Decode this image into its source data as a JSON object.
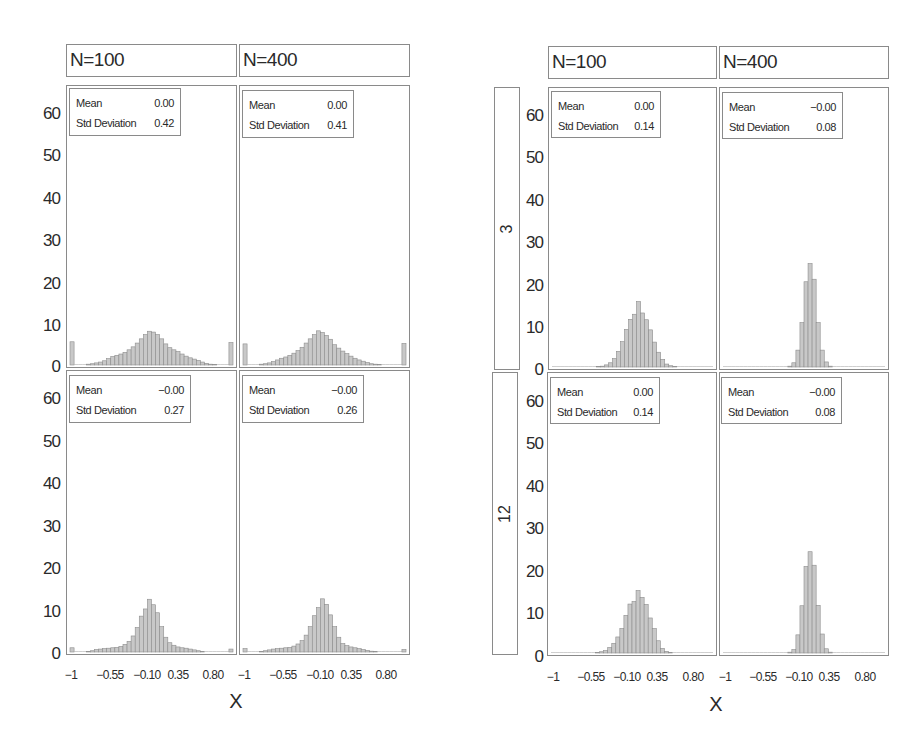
{
  "chart_data": [
    {
      "type": "bar",
      "group": "left",
      "column": "N=100",
      "row": "top",
      "title": "N=100",
      "xlabel": "X",
      "ylabel": "",
      "xticks": [
        "-1",
        "-0.55",
        "-0.10",
        "0.35",
        "0.80"
      ],
      "yticks": [
        0,
        10,
        20,
        30,
        40,
        50,
        60
      ],
      "ylim": [
        0,
        65
      ],
      "xlim": [
        -1.02,
        1.02
      ],
      "stats": {
        "mean": "0.00",
        "std": "0.42"
      },
      "bin_width": 0.05,
      "x_start": -1.0,
      "values": [
        5.5,
        0,
        0,
        0,
        0.2,
        0.3,
        0.5,
        0.7,
        1.0,
        1.5,
        2.0,
        2.3,
        2.6,
        3.0,
        3.6,
        4.3,
        5.2,
        6.2,
        7.2,
        8.0,
        7.8,
        7.2,
        6.2,
        5.0,
        4.1,
        3.6,
        3.2,
        2.6,
        2.1,
        1.7,
        1.4,
        1.1,
        0.7,
        0.4,
        0.2,
        0.1,
        0,
        0,
        0,
        5.3
      ]
    },
    {
      "type": "bar",
      "group": "left",
      "column": "N=400",
      "row": "top",
      "title": "N=400",
      "xticks": [
        "-1",
        "-0.55",
        "-0.10",
        "0.35",
        "0.80"
      ],
      "ylim": [
        0,
        65
      ],
      "stats": {
        "mean": "0.00",
        "std": "0.41"
      },
      "bin_width": 0.05,
      "x_start": -1.0,
      "values": [
        5.0,
        0,
        0,
        0,
        0.2,
        0.3,
        0.5,
        0.8,
        1.2,
        1.6,
        1.9,
        2.3,
        2.8,
        3.4,
        4.2,
        5.2,
        6.2,
        7.2,
        8.1,
        7.7,
        7.0,
        6.1,
        4.8,
        4.0,
        3.3,
        2.7,
        2.1,
        1.6,
        1.2,
        0.9,
        0.6,
        0.3,
        0.2,
        0.1,
        0,
        0,
        0,
        0,
        0,
        5.1
      ]
    },
    {
      "type": "bar",
      "group": "left",
      "column": "N=100",
      "row": "bottom",
      "xticks": [
        "-1",
        "-0.55",
        "-0.10",
        "0.35",
        "0.80"
      ],
      "ylim": [
        0,
        65
      ],
      "stats": {
        "mean": "-0.00",
        "std": "0.27"
      },
      "bin_width": 0.05,
      "x_start": -1.0,
      "values": [
        1.0,
        0,
        0,
        0,
        0.1,
        0.3,
        0.6,
        0.7,
        0.8,
        0.9,
        1.0,
        1.1,
        1.3,
        1.8,
        2.5,
        3.8,
        5.8,
        8.5,
        10.2,
        12.5,
        11.2,
        9.3,
        6.0,
        3.5,
        2.2,
        1.6,
        1.2,
        1.0,
        0.9,
        0.7,
        0.5,
        0.3,
        0.1,
        0,
        0,
        0,
        0,
        0,
        0,
        0.7
      ]
    },
    {
      "type": "bar",
      "group": "left",
      "column": "N=400",
      "row": "bottom",
      "xticks": [
        "-1",
        "-0.55",
        "-0.10",
        "0.35",
        "0.80"
      ],
      "ylim": [
        0,
        65
      ],
      "stats": {
        "mean": "-0.00",
        "std": "0.26"
      },
      "bin_width": 0.05,
      "x_start": -1.0,
      "values": [
        0.8,
        0,
        0,
        0,
        0.1,
        0.3,
        0.5,
        0.7,
        0.8,
        0.9,
        1.0,
        1.1,
        1.4,
        1.9,
        2.7,
        4.0,
        6.0,
        8.6,
        10.5,
        12.6,
        11.3,
        8.8,
        6.0,
        3.5,
        2.0,
        1.5,
        1.2,
        1.0,
        0.8,
        0.6,
        0.4,
        0.2,
        0.1,
        0,
        0,
        0,
        0,
        0,
        0,
        0.6
      ]
    },
    {
      "type": "bar",
      "group": "right",
      "column": "N=100",
      "row": "3",
      "xticks": [
        "-1",
        "-0.55",
        "-0.10",
        "0.35",
        "0.80"
      ],
      "ylim": [
        0,
        65
      ],
      "stats": {
        "mean": "0.00",
        "std": "0.14"
      },
      "bin_width": 0.05,
      "x_start": -1.0,
      "values": [
        0,
        0,
        0,
        0,
        0,
        0,
        0,
        0,
        0,
        0,
        0,
        0.1,
        0.2,
        0.5,
        1.0,
        2.0,
        3.7,
        6.0,
        8.9,
        11.3,
        12.5,
        15.5,
        12.8,
        11.2,
        8.8,
        5.9,
        3.5,
        1.8,
        0.7,
        0.3,
        0.1,
        0,
        0,
        0,
        0,
        0,
        0,
        0,
        0,
        0
      ]
    },
    {
      "type": "bar",
      "group": "right",
      "column": "N=400",
      "row": "3",
      "xticks": [
        "-1",
        "-0.55",
        "-0.10",
        "0.35",
        "0.80"
      ],
      "ylim": [
        0,
        65
      ],
      "stats": {
        "mean": "-0.00",
        "std": "0.08"
      },
      "bin_width": 0.05,
      "x_start": -1.0,
      "values": [
        0,
        0,
        0,
        0,
        0,
        0,
        0,
        0,
        0,
        0,
        0,
        0,
        0,
        0,
        0,
        0,
        0.2,
        1.0,
        4.0,
        10.5,
        20.2,
        24.5,
        20.8,
        10.5,
        4.0,
        1.2,
        0.2,
        0,
        0,
        0,
        0,
        0,
        0,
        0,
        0,
        0,
        0,
        0,
        0,
        0
      ]
    },
    {
      "type": "bar",
      "group": "right",
      "column": "N=100",
      "row": "12",
      "xticks": [
        "-1",
        "-0.55",
        "-0.10",
        "0.35",
        "0.80"
      ],
      "ylim": [
        0,
        65
      ],
      "stats": {
        "mean": "0.00",
        "std": "0.14"
      },
      "bin_width": 0.05,
      "x_start": -1.0,
      "values": [
        0,
        0,
        0,
        0,
        0,
        0,
        0,
        0,
        0,
        0,
        0,
        0.1,
        0.3,
        0.6,
        1.3,
        2.3,
        3.8,
        5.8,
        8.9,
        11.6,
        12.2,
        14.8,
        13.2,
        11.5,
        8.3,
        5.8,
        2.9,
        1.1,
        0.4,
        0.1,
        0,
        0,
        0,
        0,
        0,
        0,
        0,
        0,
        0,
        0
      ]
    },
    {
      "type": "bar",
      "group": "right",
      "column": "N=400",
      "row": "12",
      "xticks": [
        "-1",
        "-0.55",
        "-0.10",
        "0.35",
        "0.80"
      ],
      "ylim": [
        0,
        65
      ],
      "stats": {
        "mean": "-0.00",
        "std": "0.08"
      },
      "bin_width": 0.05,
      "x_start": -1.0,
      "values": [
        0,
        0,
        0,
        0,
        0,
        0,
        0,
        0,
        0,
        0,
        0,
        0,
        0,
        0,
        0,
        0,
        0.2,
        0.8,
        4.3,
        11.2,
        20.5,
        24.0,
        20.8,
        11.3,
        4.5,
        1.0,
        0.2,
        0,
        0,
        0,
        0,
        0,
        0,
        0,
        0,
        0,
        0,
        0,
        0,
        0
      ]
    }
  ],
  "labels": {
    "col_n100": "N=100",
    "col_n400": "N=400",
    "row_3": "3",
    "row_12": "12",
    "xaxis": "X",
    "mean": "Mean",
    "std": "Std Deviation",
    "yticks": [
      "60",
      "50",
      "40",
      "30",
      "20",
      "10",
      "0"
    ],
    "xticks": [
      "-1",
      "−0.55",
      "−0.10",
      "0.35",
      "0.80"
    ],
    "xtick_first": "−1"
  },
  "stats_display": {
    "left_top_n100": {
      "mean": "0.00",
      "std": "0.42"
    },
    "left_top_n400": {
      "mean": "0.00",
      "std": "0.41"
    },
    "left_bot_n100": {
      "mean": "−0.00",
      "std": "0.27"
    },
    "left_bot_n400": {
      "mean": "−0.00",
      "std": "0.26"
    },
    "right_top_n100": {
      "mean": "0.00",
      "std": "0.14"
    },
    "right_top_n400": {
      "mean": "−0.00",
      "std": "0.08"
    },
    "right_bot_n100": {
      "mean": "0.00",
      "std": "0.14"
    },
    "right_bot_n400": {
      "mean": "−0.00",
      "std": "0.08"
    }
  },
  "colors": {
    "bar_fill": "#c8c8c8",
    "bar_stroke": "#8c8c8c",
    "frame": "#8a8a8a"
  }
}
